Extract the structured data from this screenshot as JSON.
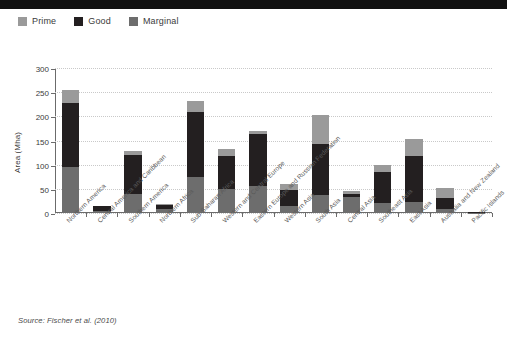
{
  "legend": {
    "position": "top-left",
    "entries": [
      {
        "label": "Prime",
        "color": "#9a9a9a"
      },
      {
        "label": "Good",
        "color": "#231f20"
      },
      {
        "label": "Marginal",
        "color": "#6d6d6d"
      }
    ]
  },
  "source_note": "Source: Fischer et al. (2010)",
  "axis": {
    "y_title": "Area (Mha)",
    "y_ticks": [
      "0",
      "50",
      "100",
      "150",
      "200",
      "250",
      "300"
    ]
  },
  "chart_data": {
    "type": "bar",
    "stacked": true,
    "title": "",
    "xlabel": "",
    "ylabel": "Area (Mha)",
    "ylim": [
      0,
      300
    ],
    "ytick_step": 50,
    "grid": true,
    "legend_position": "top-left",
    "stack_order_bottom_to_top": [
      "Marginal",
      "Good",
      "Prime"
    ],
    "categories": [
      "Northern America",
      "Central America and Caribbean",
      "Southern America",
      "Northern Africa",
      "Sub-Saharan Africa",
      "Western and Central Europe",
      "Eastern Europe and Russian Federation",
      "Western Asia",
      "South Asia",
      "Central Asia",
      "Southeast Asia",
      "East Asia",
      "Australia and New Zealand",
      "Pacific Islands"
    ],
    "series": [
      {
        "name": "Marginal",
        "color": "#6d6d6d",
        "values": [
          95,
          4,
          40,
          8,
          75,
          50,
          55,
          14,
          38,
          33,
          20,
          22,
          8,
          1
        ]
      },
      {
        "name": "Good",
        "color": "#231f20",
        "values": [
          133,
          10,
          80,
          9,
          135,
          68,
          108,
          34,
          105,
          7,
          65,
          96,
          24,
          0.5
        ]
      },
      {
        "name": "Prime",
        "color": "#9a9a9a",
        "values": [
          27,
          1,
          8,
          1,
          22,
          15,
          7,
          12,
          59,
          6,
          15,
          35,
          20,
          0.5
        ]
      }
    ],
    "totals": [
      255,
      15,
      128,
      18,
      232,
      133,
      170,
      60,
      202,
      46,
      100,
      153,
      52,
      2
    ]
  }
}
